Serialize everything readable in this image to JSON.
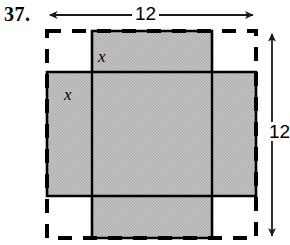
{
  "problem": {
    "number": "37."
  },
  "figure": {
    "type": "net-of-open-box-diagram",
    "outer_square": {
      "style": "dashed",
      "width_label": "12",
      "height_label": "12"
    },
    "corner_cut_label_top": "x",
    "corner_cut_label_left": "x",
    "shaded_fill_color": "#bdbdbd",
    "line_color": "#000000",
    "dimensions": {
      "top": {
        "label": "12",
        "arrow": "double-headed-horizontal"
      },
      "right": {
        "label": "12",
        "arrow": "double-headed-vertical"
      }
    }
  }
}
